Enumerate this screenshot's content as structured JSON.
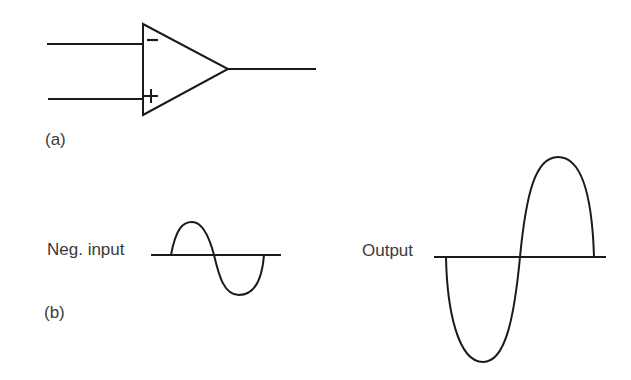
{
  "figure": {
    "panel_a": {
      "label": "(a)",
      "component": "op-amp",
      "inputs": [
        {
          "sign": "−",
          "name": "inverting-input"
        },
        {
          "sign": "+",
          "name": "non-inverting-input"
        }
      ]
    },
    "panel_b": {
      "label": "(b)",
      "neg_input_label": "Neg. input",
      "output_label": "Output"
    },
    "colors": {
      "stroke": "#1a1a1a",
      "text": "#3a3a3a",
      "background": "#ffffff"
    }
  }
}
